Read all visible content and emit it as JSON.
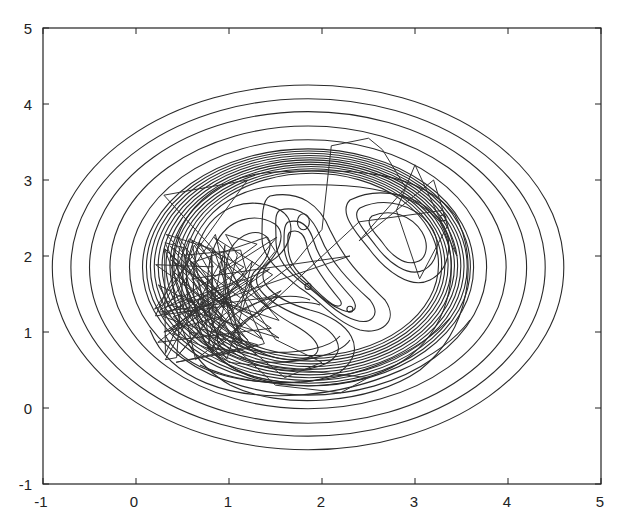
{
  "chart_data": {
    "type": "contour",
    "title": "",
    "xlabel": "",
    "ylabel": "",
    "xlim": [
      -1,
      5
    ],
    "ylim": [
      -1,
      5
    ],
    "grid": false,
    "legend": null,
    "x_ticks": [
      "-1",
      "0",
      "1",
      "2",
      "3",
      "4",
      "5"
    ],
    "y_ticks": [
      "-1",
      "0",
      "1",
      "2",
      "3",
      "4",
      "5"
    ],
    "contour_center": [
      1.85,
      1.85
    ],
    "outer_ellipses_radii": [
      {
        "rx": 2.75,
        "ry": 2.4
      },
      {
        "rx": 2.55,
        "ry": 2.22
      },
      {
        "rx": 2.35,
        "ry": 2.05
      },
      {
        "rx": 2.13,
        "ry": 1.86
      },
      {
        "rx": 1.92,
        "ry": 1.68
      }
    ],
    "dense_ring_count": 12,
    "local_minima": [
      {
        "x": 1.8,
        "y": 2.45
      },
      {
        "x": 1.85,
        "y": 1.6
      },
      {
        "x": 2.3,
        "y": 1.3
      },
      {
        "x": 3.3,
        "y": 2.5
      },
      {
        "x": 0.7,
        "y": 1.4
      }
    ],
    "trajectory_description": "Random-walk sample path concentrated around (0.8, 1.3) with excursions toward (2.3, 3.5), (3.2, 3.0), (3.3, 2.5) and (1.5, 0.2)",
    "trajectory_sample_points": [
      [
        0.7,
        1.4
      ],
      [
        1.2,
        0.9
      ],
      [
        0.4,
        1.8
      ],
      [
        0.9,
        1.2
      ],
      [
        0.3,
        1.0
      ],
      [
        1.1,
        1.6
      ],
      [
        0.6,
        2.2
      ],
      [
        0.8,
        0.8
      ],
      [
        1.3,
        0.7
      ],
      [
        0.5,
        1.5
      ],
      [
        0.2,
        1.3
      ],
      [
        0.9,
        2.5
      ],
      [
        1.2,
        3.0
      ],
      [
        0.3,
        2.8
      ],
      [
        0.9,
        2.0
      ],
      [
        1.5,
        0.9
      ],
      [
        2.0,
        0.6
      ],
      [
        1.6,
        0.4
      ],
      [
        1.0,
        1.0
      ],
      [
        0.6,
        1.7
      ],
      [
        2.3,
        2.0
      ],
      [
        1.1,
        1.5
      ],
      [
        0.4,
        1.2
      ],
      [
        1.0,
        0.6
      ],
      [
        2.5,
        0.4
      ],
      [
        2.2,
        0.2
      ],
      [
        1.5,
        0.3
      ],
      [
        0.8,
        1.1
      ],
      [
        1.7,
        1.9
      ],
      [
        2.0,
        2.35
      ],
      [
        2.1,
        3.45
      ],
      [
        2.5,
        3.55
      ],
      [
        2.65,
        3.4
      ],
      [
        2.9,
        2.9
      ],
      [
        2.4,
        2.2
      ],
      [
        3.2,
        3.0
      ],
      [
        3.35,
        2.4
      ],
      [
        3.05,
        1.7
      ],
      [
        2.8,
        2.6
      ],
      [
        3.0,
        3.2
      ],
      [
        3.45,
        2.0
      ],
      [
        3.3,
        2.6
      ],
      [
        2.4,
        2.45
      ],
      [
        1.3,
        1.2
      ],
      [
        0.7,
        1.5
      ]
    ]
  },
  "axes": {
    "x_labels": [
      "-1",
      "0",
      "1",
      "2",
      "3",
      "4",
      "5"
    ],
    "y_labels": [
      "5",
      "4",
      "3",
      "2",
      "1",
      "0",
      "-1"
    ]
  }
}
